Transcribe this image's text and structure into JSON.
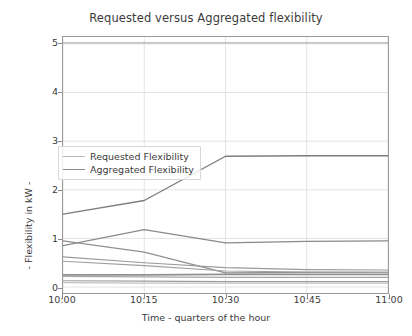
{
  "chart_data": {
    "type": "line",
    "title": "Requested versus Aggregated flexibility",
    "xlabel": "Time - quarters of the hour",
    "ylabel": "- Flexibility in kW -",
    "x": [
      "10:00",
      "10:15",
      "10:30",
      "10:45",
      "11:00"
    ],
    "xtick_labels": [
      "10:00",
      "10:15",
      "10:30",
      "10:45",
      "11:00"
    ],
    "ytick_labels": [
      "0",
      "1",
      "2",
      "3",
      "4",
      "5"
    ],
    "ytick_values": [
      0,
      1,
      2,
      3,
      4,
      5
    ],
    "ylim": [
      -0.15,
      5.22
    ],
    "xlim": [
      0,
      4
    ],
    "grid": true,
    "legend_position": "upper left",
    "legend": [
      "Requested Flexibility",
      "Aggregated Flexibility"
    ],
    "colors": {
      "requested": "#b9b9b9",
      "aggregated": "#8d8d8d",
      "grid": "#e3e3e3",
      "frame": "#9a9a9a",
      "text": "#3b3b3b",
      "background": "#ffffff"
    },
    "series": [
      {
        "name": "Requested Flexibility",
        "group": "requested",
        "color": "#b0b0b0",
        "width": 1.3,
        "values": [
          5.02,
          5.02,
          5.02,
          5.02,
          5.02
        ]
      },
      {
        "name": "Aggregated Flexibility",
        "group": "aggregated",
        "color": "#7d7d7d",
        "width": 1.4,
        "values": [
          1.5,
          1.78,
          2.69,
          2.7,
          2.7
        ]
      },
      {
        "name": "Aggregated unit 2",
        "group": "aggregated",
        "color": "#8a8a8a",
        "width": 1.3,
        "values": [
          0.85,
          1.18,
          0.91,
          0.94,
          0.95
        ]
      },
      {
        "name": "Aggregated unit 3",
        "group": "aggregated",
        "color": "#909090",
        "width": 1.3,
        "values": [
          0.95,
          0.72,
          0.29,
          0.3,
          0.3
        ]
      },
      {
        "name": "Aggregated unit 4",
        "group": "aggregated",
        "color": "#9a9a9a",
        "width": 1.2,
        "values": [
          0.62,
          0.5,
          0.4,
          0.36,
          0.35
        ]
      },
      {
        "name": "Aggregated unit 5",
        "group": "aggregated",
        "color": "#a0a0a0",
        "width": 1.2,
        "values": [
          0.53,
          0.44,
          0.33,
          0.31,
          0.3
        ]
      },
      {
        "name": "Aggregated unit 6",
        "group": "aggregated",
        "color": "#8f8f8f",
        "width": 1.6,
        "values": [
          0.25,
          0.25,
          0.26,
          0.26,
          0.26
        ]
      },
      {
        "name": "Aggregated unit 7",
        "group": "aggregated",
        "color": "#a6a6a6",
        "width": 1.2,
        "values": [
          0.22,
          0.21,
          0.2,
          0.2,
          0.2
        ]
      },
      {
        "name": "Aggregated unit 8",
        "group": "aggregated",
        "color": "#9e9e9e",
        "width": 1.2,
        "values": [
          0.13,
          0.12,
          0.11,
          0.11,
          0.11
        ]
      },
      {
        "name": "Aggregated unit 9",
        "group": "aggregated",
        "color": "#c2c2c2",
        "width": 1.1,
        "values": [
          0.09,
          0.08,
          0.08,
          0.08,
          0.08
        ]
      }
    ]
  }
}
